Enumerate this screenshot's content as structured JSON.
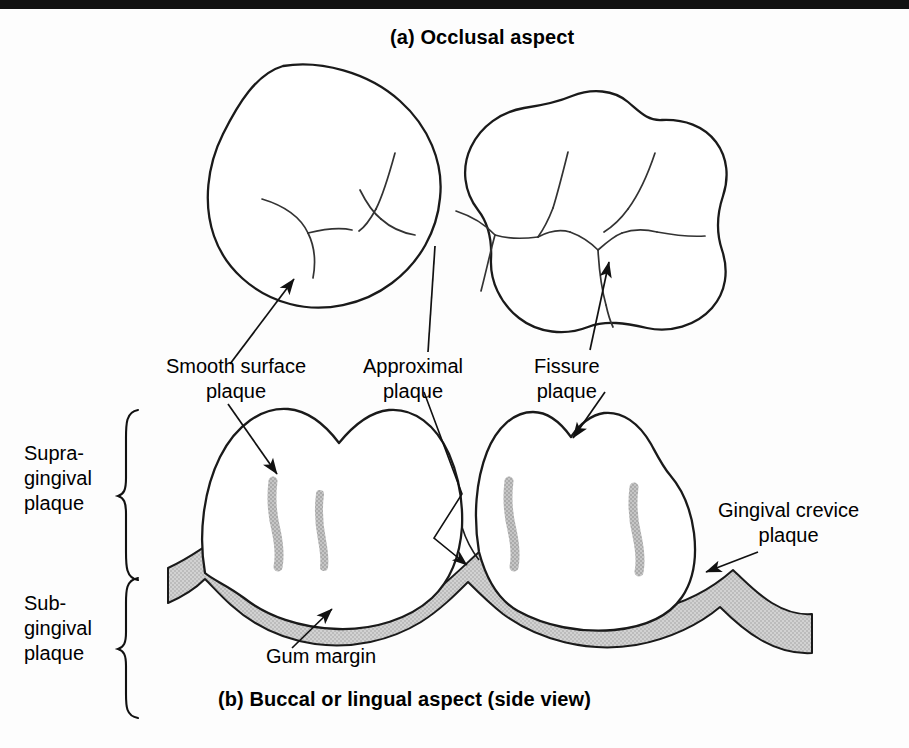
{
  "figure": {
    "caption_a": "(a) Occlusal aspect",
    "caption_b": "(b) Buccal or lingual aspect (side view)"
  },
  "labels": {
    "smooth_surface": "Smooth surface\nplaque",
    "smooth_surface_line1": "Smooth surface",
    "smooth_surface_line2": "plaque",
    "approximal_line1": "Approximal",
    "approximal_line2": "plaque",
    "fissure_line1": "Fissure",
    "fissure_line2": "plaque",
    "supragingival_line1": "Supra-",
    "supragingival_line2": "gingival",
    "supragingival_line3": "plaque",
    "subgingival_line1": "Sub-",
    "subgingival_line2": "gingival",
    "subgingival_line3": "plaque",
    "gingival_crevice_line1": "Gingival crevice",
    "gingival_crevice_line2": "plaque",
    "gum_margin": "Gum margin"
  },
  "colors": {
    "ink": "#111111",
    "outline": "#1a1a1a",
    "plaque_gray": "#b9b9b9",
    "gum_gray": "#c9c9c9",
    "background": "#fdfdfd",
    "top_bar": "#111111"
  },
  "diagram": {
    "title_topic": "Dental plaque distribution on teeth",
    "panel_a_items": [
      "left occlusal tooth (premolar)",
      "right occlusal tooth (molar with fissure pattern)"
    ],
    "panel_b_items": [
      "left tooth side view",
      "right tooth side view",
      "gum margin band",
      "plaque streaks"
    ],
    "plaque_streak_count": 4,
    "arrow_count": 7,
    "brace_count": 2
  }
}
